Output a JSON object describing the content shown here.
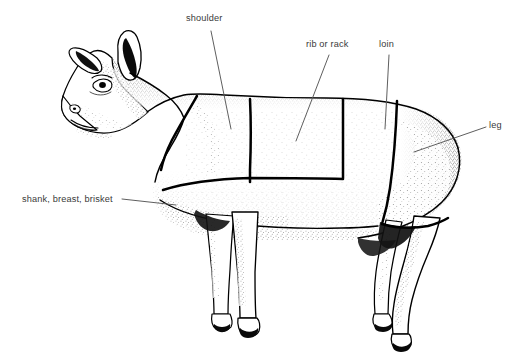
{
  "figure": {
    "background_color": "#ffffff",
    "ink_color": "#000000",
    "label_color": "#3a3a3a"
  },
  "labels": [
    {
      "id": "shoulder",
      "text": "shoulder",
      "leader": {
        "x1": 211,
        "y1": 31,
        "x2": 231,
        "y2": 129
      }
    },
    {
      "id": "rib-or-rack",
      "text": "rib or rack",
      "leader": {
        "x1": 329,
        "y1": 55,
        "x2": 296,
        "y2": 141
      }
    },
    {
      "id": "loin",
      "text": "loin",
      "leader": {
        "x1": 389,
        "y1": 55,
        "x2": 385,
        "y2": 129
      }
    },
    {
      "id": "leg",
      "text": "leg",
      "leader": {
        "x1": 486,
        "y1": 127,
        "x2": 414,
        "y2": 152
      }
    },
    {
      "id": "shank-breast-brisket",
      "text": "shank, breast, brisket",
      "leader": {
        "x1": 122,
        "y1": 199,
        "x2": 176,
        "y2": 205
      }
    }
  ],
  "cuts": [
    "shoulder",
    "rib or rack",
    "loin",
    "leg",
    "shank, breast, brisket"
  ]
}
